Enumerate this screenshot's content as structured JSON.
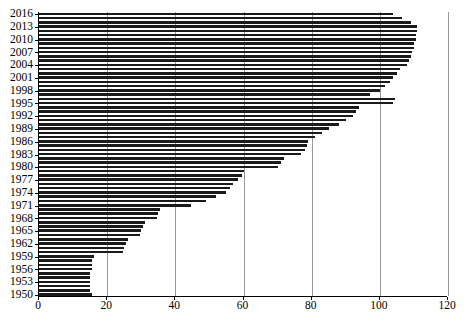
{
  "chart_data": {
    "type": "bar",
    "orientation": "horizontal",
    "title": "",
    "subtitle": "",
    "xlabel": "",
    "ylabel": "",
    "xlim": [
      0,
      120
    ],
    "ylim_categories": [
      "1950",
      "2016"
    ],
    "grid": "vertical",
    "legend": "none",
    "bar_color": "#1a1a1a",
    "xticks": [
      0,
      20,
      40,
      60,
      80,
      100,
      120
    ],
    "xtick_labels": [
      "0",
      "20",
      "40",
      "60",
      "80",
      "100",
      "120"
    ],
    "ytick_labels": [
      "2016",
      "2013",
      "2010",
      "2007",
      "2004",
      "2001",
      "1998",
      "1995",
      "1992",
      "1989",
      "1986",
      "1983",
      "1980",
      "1977",
      "1974",
      "1971",
      "1968",
      "1965",
      "1962",
      "1959",
      "1956",
      "1953",
      "1950"
    ],
    "ytick_interval_years": 3,
    "categories": [
      "1950",
      "1951",
      "1952",
      "1953",
      "1954",
      "1955",
      "1956",
      "1957",
      "1958",
      "1959",
      "1960",
      "1961",
      "1962",
      "1963",
      "1964",
      "1965",
      "1966",
      "1967",
      "1968",
      "1969",
      "1970",
      "1971",
      "1972",
      "1973",
      "1974",
      "1975",
      "1976",
      "1977",
      "1978",
      "1979",
      "1980",
      "1981",
      "1982",
      "1983",
      "1984",
      "1985",
      "1986",
      "1987",
      "1988",
      "1989",
      "1990",
      "1991",
      "1992",
      "1993",
      "1994",
      "1995",
      "1996",
      "1997",
      "1998",
      "1999",
      "2000",
      "2001",
      "2002",
      "2003",
      "2004",
      "2005",
      "2006",
      "2007",
      "2008",
      "2009",
      "2010",
      "2011",
      "2012",
      "2013",
      "2014",
      "2015",
      "2016"
    ],
    "values": [
      15.5,
      15.0,
      15.0,
      15.0,
      15.0,
      15.0,
      15.5,
      15.5,
      15.5,
      16.0,
      24.5,
      25.0,
      25.5,
      26.0,
      29.5,
      30.0,
      30.5,
      31.0,
      34.5,
      35.0,
      35.5,
      44.5,
      49.0,
      52.0,
      55.0,
      56.0,
      57.0,
      58.5,
      59.5,
      60.0,
      70.0,
      71.0,
      72.0,
      77.0,
      78.0,
      78.5,
      79.0,
      81.0,
      83.0,
      85.0,
      88.0,
      90.0,
      92.0,
      93.0,
      94.0,
      104.0,
      104.5,
      97.0,
      100.0,
      101.5,
      103.0,
      104.0,
      105.0,
      106.0,
      108.0,
      108.5,
      109.0,
      109.5,
      110.0,
      110.0,
      110.5,
      110.5,
      111.0,
      111.0,
      109.0,
      106.5,
      104.0
    ]
  }
}
